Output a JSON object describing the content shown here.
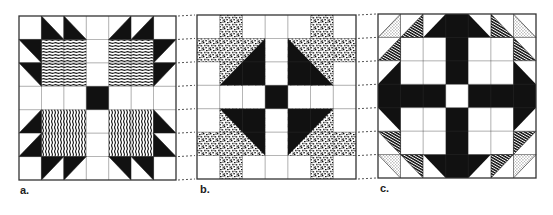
{
  "figure": {
    "width": 553,
    "height": 215,
    "colors": {
      "ink": "#111111",
      "paper": "#ffffff",
      "grid": "#333333",
      "dotted": "#555555"
    },
    "grid_size": 7,
    "blocks": [
      {
        "id": "a",
        "label": "a.",
        "x": 19,
        "y": 16,
        "w": 157,
        "h": 164,
        "label_pos": {
          "x": 20,
          "y": 184
        },
        "fills": [
          {
            "r": 3,
            "c": 3,
            "type": "solid"
          },
          {
            "r": 1,
            "c": 1,
            "w": 2,
            "h": 2,
            "type": "hlines"
          },
          {
            "r": 1,
            "c": 4,
            "w": 2,
            "h": 2,
            "type": "hlines"
          },
          {
            "r": 4,
            "c": 1,
            "w": 2,
            "h": 2,
            "type": "vlines"
          },
          {
            "r": 4,
            "c": 4,
            "w": 2,
            "h": 2,
            "type": "vlines"
          }
        ],
        "triangles": [
          {
            "r": 0,
            "c": 1,
            "corner": "bl",
            "type": "solid"
          },
          {
            "r": 0,
            "c": 2,
            "corner": "bl",
            "type": "solid"
          },
          {
            "r": 1,
            "c": 0,
            "corner": "tr",
            "type": "solid"
          },
          {
            "r": 2,
            "c": 0,
            "corner": "tr",
            "type": "solid"
          },
          {
            "r": 0,
            "c": 4,
            "corner": "br",
            "type": "solid"
          },
          {
            "r": 0,
            "c": 5,
            "corner": "br",
            "type": "solid"
          },
          {
            "r": 1,
            "c": 6,
            "corner": "tl",
            "type": "solid"
          },
          {
            "r": 2,
            "c": 6,
            "corner": "tl",
            "type": "solid"
          },
          {
            "r": 4,
            "c": 0,
            "corner": "br",
            "type": "solid"
          },
          {
            "r": 5,
            "c": 0,
            "corner": "br",
            "type": "solid"
          },
          {
            "r": 6,
            "c": 1,
            "corner": "tl",
            "type": "solid"
          },
          {
            "r": 6,
            "c": 2,
            "corner": "tl",
            "type": "solid"
          },
          {
            "r": 4,
            "c": 6,
            "corner": "bl",
            "type": "solid"
          },
          {
            "r": 5,
            "c": 6,
            "corner": "bl",
            "type": "solid"
          },
          {
            "r": 6,
            "c": 4,
            "corner": "tr",
            "type": "solid"
          },
          {
            "r": 6,
            "c": 5,
            "corner": "tr",
            "type": "solid"
          }
        ]
      },
      {
        "id": "b",
        "label": "b.",
        "x": 197,
        "y": 15,
        "w": 159,
        "h": 164,
        "label_pos": {
          "x": 200,
          "y": 183
        },
        "fills": [
          {
            "r": 3,
            "c": 3,
            "type": "solid"
          },
          {
            "r": 0,
            "c": 1,
            "w": 1,
            "h": 3,
            "type": "speckle"
          },
          {
            "r": 1,
            "c": 0,
            "w": 2,
            "h": 1,
            "type": "speckle"
          },
          {
            "r": 0,
            "c": 5,
            "w": 1,
            "h": 3,
            "type": "speckle"
          },
          {
            "r": 1,
            "c": 5,
            "w": 2,
            "h": 1,
            "type": "speckle"
          },
          {
            "r": 4,
            "c": 1,
            "w": 1,
            "h": 3,
            "type": "speckle"
          },
          {
            "r": 5,
            "c": 0,
            "w": 2,
            "h": 1,
            "type": "speckle"
          },
          {
            "r": 4,
            "c": 5,
            "w": 1,
            "h": 3,
            "type": "speckle"
          },
          {
            "r": 5,
            "c": 5,
            "w": 2,
            "h": 1,
            "type": "speckle"
          }
        ],
        "big_triangles": [
          {
            "r": 1,
            "c": 1,
            "size": 2,
            "corner": "br",
            "type": "solid",
            "other": "speckle"
          },
          {
            "r": 1,
            "c": 4,
            "size": 2,
            "corner": "bl",
            "type": "solid",
            "other": "speckle"
          },
          {
            "r": 4,
            "c": 1,
            "size": 2,
            "corner": "tr",
            "type": "solid",
            "other": "speckle"
          },
          {
            "r": 4,
            "c": 4,
            "size": 2,
            "corner": "tl",
            "type": "solid",
            "other": "speckle"
          }
        ],
        "triangles": []
      },
      {
        "id": "c",
        "label": "c.",
        "x": 378,
        "y": 14,
        "w": 158,
        "h": 164,
        "label_pos": {
          "x": 380,
          "y": 182
        },
        "fills": [
          {
            "r": 0,
            "c": 3,
            "w": 1,
            "h": 7,
            "type": "solid"
          },
          {
            "r": 3,
            "c": 0,
            "w": 7,
            "h": 1,
            "type": "solid"
          },
          {
            "r": 3,
            "c": 3,
            "type": "white"
          },
          {
            "r": 0,
            "c": 2,
            "w": 3,
            "h": 1,
            "type": "solid"
          },
          {
            "r": 6,
            "c": 2,
            "w": 3,
            "h": 1,
            "type": "solid"
          },
          {
            "r": 2,
            "c": 0,
            "w": 1,
            "h": 3,
            "type": "solid"
          },
          {
            "r": 2,
            "c": 6,
            "w": 1,
            "h": 3,
            "type": "solid"
          },
          {
            "r": 1,
            "c": 1,
            "w": 2,
            "h": 2,
            "type": "white"
          },
          {
            "r": 1,
            "c": 4,
            "w": 2,
            "h": 2,
            "type": "white"
          },
          {
            "r": 4,
            "c": 1,
            "w": 2,
            "h": 2,
            "type": "white"
          },
          {
            "r": 4,
            "c": 4,
            "w": 2,
            "h": 2,
            "type": "white"
          }
        ],
        "triangles": [
          {
            "r": 0,
            "c": 0,
            "corner": "br",
            "type": "dots"
          },
          {
            "r": 0,
            "c": 1,
            "corner": "br",
            "type": "hatch"
          },
          {
            "r": 1,
            "c": 0,
            "corner": "br",
            "type": "hatch"
          },
          {
            "r": 0,
            "c": 2,
            "corner": "tl",
            "type": "white",
            "base": "solid"
          },
          {
            "r": 2,
            "c": 0,
            "corner": "tl",
            "type": "white",
            "base": "solid"
          },
          {
            "r": 0,
            "c": 6,
            "corner": "bl",
            "type": "dots"
          },
          {
            "r": 0,
            "c": 5,
            "corner": "bl",
            "type": "hatch"
          },
          {
            "r": 1,
            "c": 6,
            "corner": "bl",
            "type": "hatch"
          },
          {
            "r": 0,
            "c": 4,
            "corner": "tr",
            "type": "white",
            "base": "solid"
          },
          {
            "r": 2,
            "c": 6,
            "corner": "tr",
            "type": "white",
            "base": "solid"
          },
          {
            "r": 6,
            "c": 0,
            "corner": "tr",
            "type": "dots"
          },
          {
            "r": 6,
            "c": 1,
            "corner": "tr",
            "type": "hatch"
          },
          {
            "r": 5,
            "c": 0,
            "corner": "tr",
            "type": "hatch"
          },
          {
            "r": 6,
            "c": 2,
            "corner": "bl",
            "type": "white",
            "base": "solid"
          },
          {
            "r": 4,
            "c": 0,
            "corner": "bl",
            "type": "white",
            "base": "solid"
          },
          {
            "r": 6,
            "c": 6,
            "corner": "tl",
            "type": "dots"
          },
          {
            "r": 6,
            "c": 5,
            "corner": "tl",
            "type": "hatch"
          },
          {
            "r": 5,
            "c": 6,
            "corner": "tl",
            "type": "hatch"
          },
          {
            "r": 6,
            "c": 4,
            "corner": "br",
            "type": "white",
            "base": "solid"
          },
          {
            "r": 4,
            "c": 6,
            "corner": "br",
            "type": "white",
            "base": "solid"
          }
        ]
      }
    ],
    "connectors": {
      "between": [
        [
          "a",
          "b"
        ],
        [
          "b",
          "c"
        ]
      ],
      "rows": [
        0,
        1,
        2,
        3,
        4,
        5,
        6,
        7
      ]
    }
  }
}
